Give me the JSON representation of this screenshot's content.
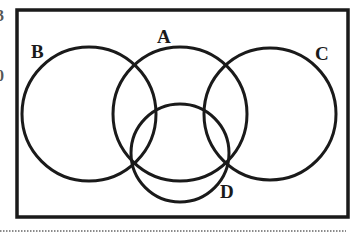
{
  "diagram": {
    "type": "venn",
    "sets": [
      {
        "id": "A",
        "label": "A",
        "cx": 180,
        "cy": 114,
        "r": 67
      },
      {
        "id": "B",
        "label": "B",
        "cx": 89,
        "cy": 114,
        "r": 67
      },
      {
        "id": "C",
        "label": "C",
        "cx": 270,
        "cy": 114,
        "r": 66
      },
      {
        "id": "D",
        "label": "D",
        "cx": 180,
        "cy": 153,
        "r": 49
      }
    ],
    "labels": {
      "A": "A",
      "B": "B",
      "C": "C",
      "D": "D"
    },
    "universe_frame": {
      "x": 17,
      "y": 10,
      "width": 331,
      "height": 207
    },
    "stroke_color": "#1a1a1a",
    "background": "#ffffff",
    "separator": {
      "style": "dotted",
      "y": 231,
      "x1": 0,
      "x2": 346
    }
  },
  "edge_fragments": {
    "top": "3",
    "middle": "0"
  }
}
